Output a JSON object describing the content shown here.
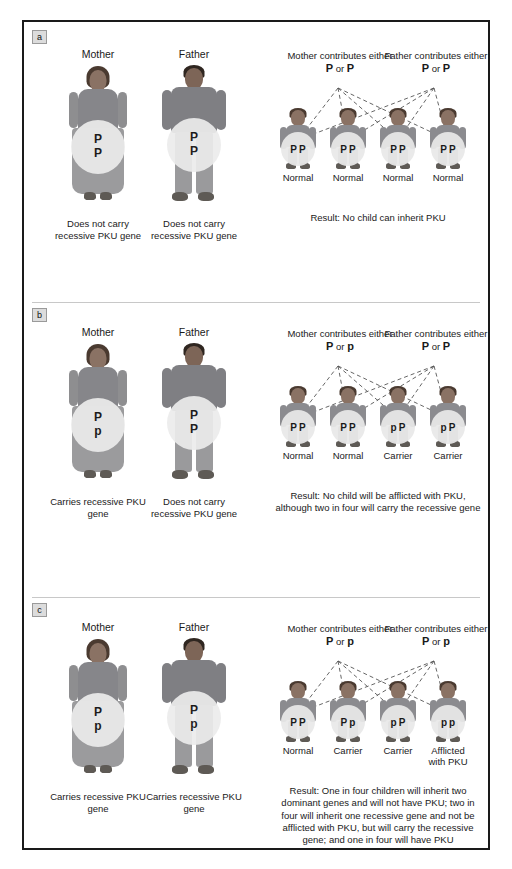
{
  "figure": {
    "panels": [
      {
        "letter": "a",
        "parents": {
          "mother": {
            "title": "Mother",
            "alleles": [
              "P",
              "P"
            ],
            "caption": "Does not carry recessive PKU gene"
          },
          "father": {
            "title": "Father",
            "alleles": [
              "P",
              "P"
            ],
            "caption": "Does not carry recessive PKU gene"
          }
        },
        "contributions": {
          "mother": {
            "label": "Mother contributes either",
            "alleles": "P or P"
          },
          "father": {
            "label": "Father contributes either",
            "alleles": "P or P"
          }
        },
        "children": [
          {
            "alleles": [
              "P",
              "P"
            ],
            "label": "Normal"
          },
          {
            "alleles": [
              "P",
              "P"
            ],
            "label": "Normal"
          },
          {
            "alleles": [
              "P",
              "P"
            ],
            "label": "Normal"
          },
          {
            "alleles": [
              "P",
              "P"
            ],
            "label": "Normal"
          }
        ],
        "result": "Result: No child can inherit PKU"
      },
      {
        "letter": "b",
        "parents": {
          "mother": {
            "title": "Mother",
            "alleles": [
              "P",
              "p"
            ],
            "caption": "Carries recessive PKU gene"
          },
          "father": {
            "title": "Father",
            "alleles": [
              "P",
              "P"
            ],
            "caption": "Does not carry recessive PKU gene"
          }
        },
        "contributions": {
          "mother": {
            "label": "Mother contributes either",
            "alleles": "P or p"
          },
          "father": {
            "label": "Father contributes either",
            "alleles": "P or P"
          }
        },
        "children": [
          {
            "alleles": [
              "P",
              "P"
            ],
            "label": "Normal"
          },
          {
            "alleles": [
              "P",
              "P"
            ],
            "label": "Normal"
          },
          {
            "alleles": [
              "p",
              "P"
            ],
            "label": "Carrier"
          },
          {
            "alleles": [
              "p",
              "P"
            ],
            "label": "Carrier"
          }
        ],
        "result": "Result: No child will be afflicted with PKU, although two in four will carry the recessive gene"
      },
      {
        "letter": "c",
        "parents": {
          "mother": {
            "title": "Mother",
            "alleles": [
              "P",
              "p"
            ],
            "caption": "Carries recessive PKU gene"
          },
          "father": {
            "title": "Father",
            "alleles": [
              "P",
              "p"
            ],
            "caption": "Carries recessive PKU gene"
          }
        },
        "contributions": {
          "mother": {
            "label": "Mother contributes either",
            "alleles": "P or p"
          },
          "father": {
            "label": "Father contributes either",
            "alleles": "P or p"
          }
        },
        "children": [
          {
            "alleles": [
              "P",
              "P"
            ],
            "label": "Normal"
          },
          {
            "alleles": [
              "P",
              "p"
            ],
            "label": "Carrier"
          },
          {
            "alleles": [
              "p",
              "P"
            ],
            "label": "Carrier"
          },
          {
            "alleles": [
              "p",
              "p"
            ],
            "label": "Afflicted with PKU"
          }
        ],
        "result": "Result: One in four children will inherit two dominant genes and will not have PKU; two in four will inherit one recessive gene and not be afflicted with PKU, but will carry the recessive gene; and one in four will have PKU"
      }
    ]
  },
  "colors": {
    "frame_border": "#1a1a1a",
    "genotype_circle": "#ececec",
    "panel_letter_bg": "#dcdcdc",
    "text": "#1a1a1a",
    "cross_line": "#555555"
  }
}
